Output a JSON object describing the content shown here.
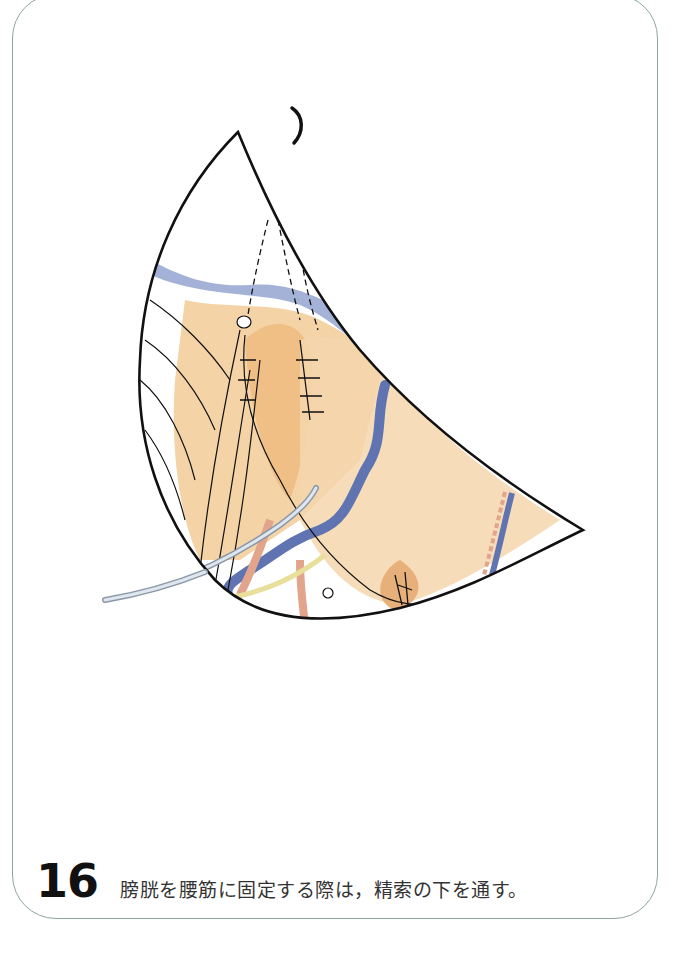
{
  "figure": {
    "number": "16",
    "caption": "膀胱を腰筋に固定する際は，精索の下を通す。",
    "illustration": "surgical-illustration-psoas-hitch",
    "colors": {
      "outline": "#111111",
      "tissue": "#efc38e",
      "tissue_light": "#f7dcb6",
      "vein": "#5f74b0",
      "vessel_pink": "#e3a48c",
      "catheter": "#c9d2dc",
      "yellow_cord": "#e8df9a",
      "frame": "#8fa79a"
    }
  }
}
